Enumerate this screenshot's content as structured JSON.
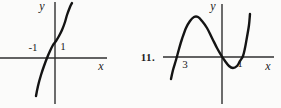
{
  "figure": {
    "background": "#fbfbfa",
    "curve_color": "#141414",
    "axis_color": "#2f2f2f"
  },
  "chart_data": [
    {
      "type": "line",
      "title": "",
      "xlabel": "x",
      "ylabel": "y",
      "x_tick_labels": [
        "-1",
        "1"
      ],
      "x_ticks_shown": [
        -1,
        1
      ],
      "x_intercepts_approx": [
        -0.5
      ],
      "description": "Increasing S-shaped cubic curve; crosses the x-axis once between -1 and 0 (near x = -0.5), crosses the y-axis near y = 1; shape resembles y = 2x^3 + x + 0.6",
      "axis_px": {
        "origin": [
          55,
          58
        ],
        "x_start": 0,
        "x_end": 107,
        "y_start": 2,
        "y_end": 104
      },
      "curve_px": [
        [
          36,
          96
        ],
        [
          38,
          86
        ],
        [
          41,
          75
        ],
        [
          44,
          66
        ],
        [
          47,
          58
        ],
        [
          50,
          51
        ],
        [
          53,
          45
        ],
        [
          56,
          41
        ],
        [
          59,
          36
        ],
        [
          62,
          30
        ],
        [
          65,
          22
        ],
        [
          67,
          15
        ],
        [
          70,
          7
        ],
        [
          72,
          3
        ]
      ],
      "labels": [
        {
          "text": "y",
          "x": 42,
          "y": 6
        },
        {
          "text": "-1",
          "x": 33,
          "y": 47
        },
        {
          "text": "1",
          "x": 63,
          "y": 46
        },
        {
          "text": "x",
          "x": 101,
          "y": 66
        }
      ]
    },
    {
      "type": "line",
      "title": "",
      "item_number": "11.",
      "xlabel": "x",
      "ylabel": "y",
      "x_tick_labels": [
        "3",
        "1"
      ],
      "x_ticks_shown": [
        -3,
        1
      ],
      "x_intercepts_approx": [
        -3,
        0,
        1
      ],
      "description": "Cubic curve with x-intercepts near x = -3, x = 0 and x = 1; local maximum above the axis between -3 and 0, local minimum below the axis between 0 and 1; shape resembles y = -x(x+3)(x-1)",
      "axis_px": {
        "origin": [
          222,
          57
        ],
        "x_start": 163,
        "x_end": 274,
        "y_start": 4,
        "y_end": 104
      },
      "curve_px": [
        [
          171,
          79
        ],
        [
          173,
          70
        ],
        [
          176,
          60
        ],
        [
          179,
          49
        ],
        [
          182,
          39
        ],
        [
          186,
          28
        ],
        [
          190,
          21
        ],
        [
          194,
          17
        ],
        [
          198,
          17
        ],
        [
          202,
          21
        ],
        [
          207,
          28
        ],
        [
          212,
          38
        ],
        [
          217,
          48
        ],
        [
          221,
          55
        ],
        [
          225,
          61
        ],
        [
          229,
          66
        ],
        [
          233,
          68
        ],
        [
          237,
          66
        ],
        [
          240,
          61
        ],
        [
          243,
          56
        ],
        [
          245,
          48
        ],
        [
          247,
          37
        ],
        [
          249,
          25
        ],
        [
          250,
          14
        ]
      ],
      "labels": [
        {
          "text": "11.",
          "x": 148,
          "y": 57
        },
        {
          "text": "y",
          "x": 213,
          "y": 6
        },
        {
          "text": "3",
          "x": 185,
          "y": 64
        },
        {
          "text": "1",
          "x": 240,
          "y": 63
        },
        {
          "text": "x",
          "x": 268,
          "y": 66
        }
      ]
    }
  ]
}
